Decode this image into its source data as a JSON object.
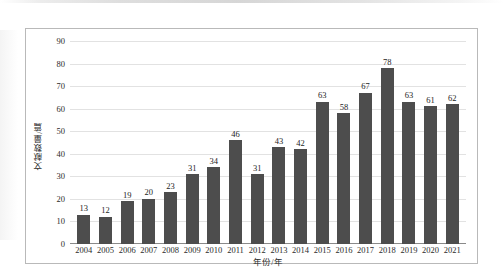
{
  "chart_data": {
    "type": "bar",
    "title": "",
    "xlabel": "年份/年",
    "ylabel": "文献数量/篇",
    "categories": [
      "2004",
      "2005",
      "2006",
      "2007",
      "2008",
      "2009",
      "2010",
      "2011",
      "2012",
      "2013",
      "2014",
      "2015",
      "2016",
      "2017",
      "2018",
      "2019",
      "2020",
      "2021"
    ],
    "values": [
      13,
      12,
      19,
      20,
      23,
      31,
      34,
      46,
      31,
      43,
      42,
      63,
      58,
      67,
      78,
      63,
      61,
      62
    ],
    "data_labels": [
      "13",
      "12",
      "19",
      "20",
      "23",
      "31",
      "34",
      "46",
      "31",
      "43",
      "42",
      "63",
      "58",
      "67",
      "78",
      "63",
      "61",
      "62"
    ],
    "ylim": [
      0,
      90
    ],
    "y_ticks": [
      "0",
      "10",
      "20",
      "30",
      "40",
      "50",
      "60",
      "70",
      "80",
      "90"
    ],
    "y_tick_values": [
      0,
      10,
      20,
      30,
      40,
      50,
      60,
      70,
      80,
      90
    ],
    "grid": true,
    "grid_axis": "y",
    "legend": false,
    "legend_position": "none",
    "bar_color": "#4d4d4d",
    "gridline_color": "#e2e2e2",
    "axis_color": "#8a8a8a",
    "border_color": "#b9b9b9",
    "background_color": "#ffffff",
    "text_color": "#2b2b2b"
  }
}
